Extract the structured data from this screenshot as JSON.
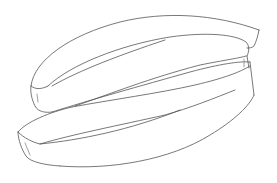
{
  "figure": {
    "style": "patent-style black line art on white",
    "colors": {
      "background": "#ffffff",
      "stroke": "#555555"
    }
  }
}
